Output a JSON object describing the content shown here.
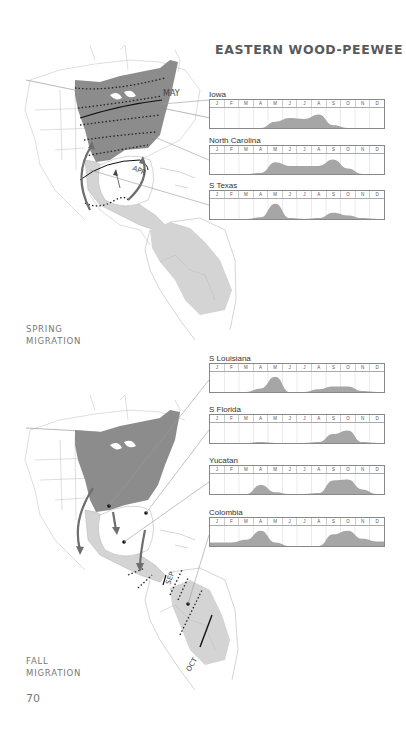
{
  "page": {
    "title": "EASTERN WOOD-PEEWEE",
    "page_number": "70",
    "spring_label_line1": "SPRING",
    "spring_label_line2": "MIGRATION",
    "fall_label_line1": "FALL",
    "fall_label_line2": "MIGRATION"
  },
  "maps": {
    "spring": {
      "labels": [
        "MAY",
        "APR"
      ]
    },
    "fall": {
      "labels": [
        "SEP",
        "OCT"
      ]
    }
  },
  "months": [
    "J",
    "F",
    "M",
    "A",
    "M",
    "J",
    "J",
    "A",
    "S",
    "O",
    "N",
    "D"
  ],
  "colors": {
    "range_dark": "#8c8c8c",
    "range_light": "#d4d4d4",
    "chart_fill": "#a6a6a6",
    "arrow": "#707070"
  },
  "chart_data": [
    {
      "type": "area",
      "title": "Iowa",
      "section": "spring",
      "x": [
        "J",
        "F",
        "M",
        "A",
        "M",
        "J",
        "J",
        "A",
        "S",
        "O",
        "N",
        "D"
      ],
      "values": [
        0,
        0,
        0,
        0,
        0.35,
        0.55,
        0.5,
        0.75,
        0.15,
        0,
        0,
        0
      ],
      "xlabel": "",
      "ylabel": "relative abundance",
      "ylim": [
        0,
        1
      ],
      "grid": true
    },
    {
      "type": "area",
      "title": "North Carolina",
      "section": "spring",
      "x": [
        "J",
        "F",
        "M",
        "A",
        "M",
        "J",
        "J",
        "A",
        "S",
        "O",
        "N",
        "D"
      ],
      "values": [
        0,
        0,
        0,
        0.05,
        0.65,
        0.45,
        0.45,
        0.45,
        0.8,
        0.3,
        0,
        0
      ],
      "xlabel": "",
      "ylabel": "relative abundance",
      "ylim": [
        0,
        1
      ],
      "grid": true
    },
    {
      "type": "area",
      "title": "S Texas",
      "section": "spring",
      "x": [
        "J",
        "F",
        "M",
        "A",
        "M",
        "J",
        "J",
        "A",
        "S",
        "O",
        "N",
        "D"
      ],
      "values": [
        0,
        0,
        0,
        0.1,
        0.85,
        0.05,
        0,
        0.05,
        0.35,
        0.2,
        0.05,
        0
      ],
      "xlabel": "",
      "ylabel": "relative abundance",
      "ylim": [
        0,
        1
      ],
      "grid": true
    },
    {
      "type": "area",
      "title": "S Louisiana",
      "section": "fall",
      "x": [
        "J",
        "F",
        "M",
        "A",
        "M",
        "J",
        "J",
        "A",
        "S",
        "O",
        "N",
        "D"
      ],
      "values": [
        0,
        0,
        0,
        0.2,
        0.85,
        0,
        0,
        0.15,
        0.3,
        0.3,
        0.05,
        0
      ],
      "xlabel": "",
      "ylabel": "relative abundance",
      "ylim": [
        0,
        1
      ],
      "grid": true
    },
    {
      "type": "area",
      "title": "S Florida",
      "section": "fall",
      "x": [
        "J",
        "F",
        "M",
        "A",
        "M",
        "J",
        "J",
        "A",
        "S",
        "O",
        "N",
        "D"
      ],
      "values": [
        0,
        0,
        0,
        0.05,
        0,
        0,
        0,
        0.05,
        0.5,
        0.7,
        0.05,
        0
      ],
      "xlabel": "",
      "ylabel": "relative abundance",
      "ylim": [
        0,
        1
      ],
      "grid": true
    },
    {
      "type": "area",
      "title": "Yucatan",
      "section": "fall",
      "x": [
        "J",
        "F",
        "M",
        "A",
        "M",
        "J",
        "J",
        "A",
        "S",
        "O",
        "N",
        "D"
      ],
      "values": [
        0,
        0,
        0,
        0.5,
        0.1,
        0,
        0,
        0.05,
        0.75,
        0.8,
        0.25,
        0
      ],
      "xlabel": "",
      "ylabel": "relative abundance",
      "ylim": [
        0,
        1
      ],
      "grid": true
    },
    {
      "type": "area",
      "title": "Colombia",
      "section": "fall",
      "x": [
        "J",
        "F",
        "M",
        "A",
        "M",
        "J",
        "J",
        "A",
        "S",
        "O",
        "N",
        "D"
      ],
      "values": [
        0.2,
        0.2,
        0.35,
        0.85,
        0.2,
        0,
        0,
        0,
        0.65,
        0.85,
        0.4,
        0.25
      ],
      "xlabel": "",
      "ylabel": "relative abundance",
      "ylim": [
        0,
        1
      ],
      "grid": true
    }
  ]
}
